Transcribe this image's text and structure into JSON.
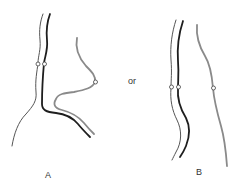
{
  "labels": {
    "panel_a": "A",
    "separator": "or",
    "panel_b": "B"
  },
  "colors": {
    "thin_line": "#555555",
    "thick_line": "#1e1e1e",
    "gray_line": "#8a8a8a",
    "background": "#ffffff"
  },
  "panels": [
    {
      "id": "A",
      "lines": [
        {
          "name": "thin-line",
          "style": "thin dark gray",
          "node": true
        },
        {
          "name": "thick-line",
          "style": "thick black",
          "node": true
        },
        {
          "name": "gray-line",
          "style": "medium gray",
          "node": true
        }
      ]
    },
    {
      "id": "B",
      "lines": [
        {
          "name": "thin-line",
          "style": "thin dark gray",
          "node": true
        },
        {
          "name": "thick-line",
          "style": "thick black",
          "node": true
        },
        {
          "name": "gray-line",
          "style": "medium gray",
          "node": true
        }
      ]
    }
  ]
}
